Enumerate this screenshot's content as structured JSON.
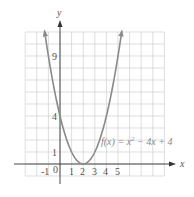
{
  "chart_data": {
    "type": "line",
    "title": "",
    "xlabel": "x",
    "ylabel": "y",
    "xlim": [
      -3,
      9
    ],
    "ylim": [
      -1,
      11
    ],
    "grid": true,
    "x_ticks": [
      "-1",
      "0",
      "1",
      "2",
      "3",
      "4",
      "5"
    ],
    "y_ticks": [
      "1",
      "4",
      "9"
    ],
    "series": [
      {
        "name": "f(x) = x^2 - 4x + 4",
        "expression": "x^2 - 4x + 4",
        "x": [
          -1.3,
          -1,
          0,
          1,
          2,
          3,
          4,
          5,
          5.3
        ],
        "y": [
          10.89,
          9,
          4,
          1,
          0,
          1,
          4,
          9,
          10.89
        ]
      }
    ],
    "annotation": {
      "text_prefix": "f(x) = x",
      "text_sup": "2",
      "text_suffix": " − 4x + 4"
    },
    "colors": {
      "curve": "#8a8a8a",
      "grid": "#d0d0d0",
      "axis": "#333333"
    }
  }
}
